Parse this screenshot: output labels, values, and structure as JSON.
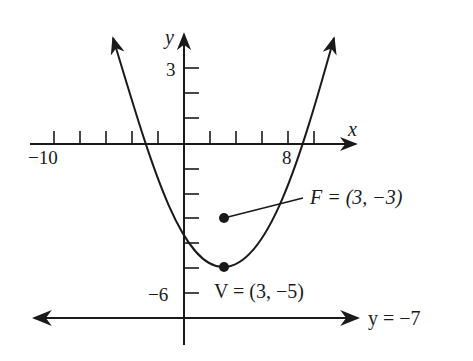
{
  "diagram": {
    "axes": {
      "x_label": "x",
      "y_label": "y",
      "x_tick_labels": [
        {
          "value": -10,
          "text": "−10"
        },
        {
          "value": 8,
          "text": "8"
        }
      ],
      "y_tick_labels": [
        {
          "value": 3,
          "text": "3"
        },
        {
          "value": -6,
          "text": "−6"
        }
      ],
      "x_tick_step": 2,
      "y_tick_step": 1
    },
    "focus": {
      "label": "F = (3, −3)",
      "x": 3,
      "y": -3
    },
    "vertex": {
      "label": "V = (3, −5)",
      "x": 3,
      "y": -5
    },
    "directrix": {
      "label": "y = −7",
      "y": -7
    },
    "curve": {
      "type": "parabola",
      "opens": "up",
      "equation": "(x − 3)² = 8(y + 5)"
    },
    "colors": {
      "ink": "#1a1a1a",
      "background": "#ffffff"
    }
  }
}
